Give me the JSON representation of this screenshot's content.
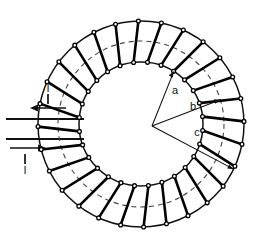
{
  "figure": {
    "background_color": "#ffffff",
    "line_color": "#111111",
    "winding_color": "#000000",
    "dashed_circle_color": "#333333",
    "width": 279,
    "height": 242
  },
  "geometry": {
    "center_x": 141,
    "center_y": 124,
    "inner_radius": 62,
    "mean_radius": 83,
    "outer_radius": 103,
    "winding_count": 28,
    "winding_start_angle_deg": -84,
    "radius_vertex_x": 152,
    "radius_vertex_y": 126
  },
  "radii": [
    {
      "label": "a",
      "name": "inner-radius",
      "angle_deg": -58,
      "ends_at": "inner_radius",
      "label_x": 175,
      "label_y": 94
    },
    {
      "label": "b",
      "name": "mean-radius",
      "angle_deg": -17,
      "ends_at": "mean_radius",
      "label_x": 193,
      "label_y": 110
    },
    {
      "label": "c",
      "name": "outer-radius",
      "angle_deg": 26,
      "ends_at": "outer_radius",
      "label_x": 197,
      "label_y": 136
    }
  ],
  "leads": {
    "top_lead": {
      "current_label": "I",
      "direction": "left",
      "wire_y": 119,
      "wire_x_start": 6,
      "arrow_y": 108,
      "arrow_x_start": 66,
      "arrow_x_end": 30,
      "label_x": 48,
      "label_y": 100
    },
    "bottom_lead": {
      "current_label": "I",
      "direction": "right",
      "wire_y": 139,
      "wire_x_start": 6,
      "arrow_y": 148,
      "arrow_x_start": 10,
      "arrow_x_end": 46,
      "label_x": 25,
      "label_y": 166
    }
  },
  "chart_data": {
    "type": "diagram",
    "annotations": [
      "a",
      "b",
      "c",
      "I",
      "I"
    ]
  }
}
